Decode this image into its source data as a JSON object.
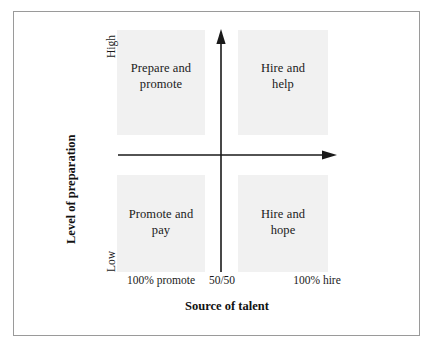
{
  "figure": {
    "type": "two-by-two-matrix",
    "background_color": "#ffffff",
    "frame_color": "#9a9a9a",
    "quadrant_fill_color": "#f1f1f1",
    "axis_color": "#1a1a1a"
  },
  "axes": {
    "x": {
      "title": "Source of talent",
      "ticks": [
        {
          "label": "100% promote",
          "position": "left"
        },
        {
          "label": "50/50",
          "position": "center"
        },
        {
          "label": "100% hire",
          "position": "right"
        }
      ]
    },
    "y": {
      "title": "Level of preparation",
      "ticks": [
        {
          "label": "High",
          "position": "top"
        },
        {
          "label": "Low",
          "position": "bottom"
        }
      ]
    }
  },
  "quadrants": [
    {
      "id": "top-left",
      "line1": "Prepare and",
      "line2": "promote",
      "x_level": "100% promote",
      "y_level": "High"
    },
    {
      "id": "top-right",
      "line1": "Hire and",
      "line2": "help",
      "x_level": "100% hire",
      "y_level": "High"
    },
    {
      "id": "bottom-left",
      "line1": "Promote and",
      "line2": "pay",
      "x_level": "100% promote",
      "y_level": "Low"
    },
    {
      "id": "bottom-right",
      "line1": "Hire and",
      "line2": "hope",
      "x_level": "100% hire",
      "y_level": "Low"
    }
  ]
}
